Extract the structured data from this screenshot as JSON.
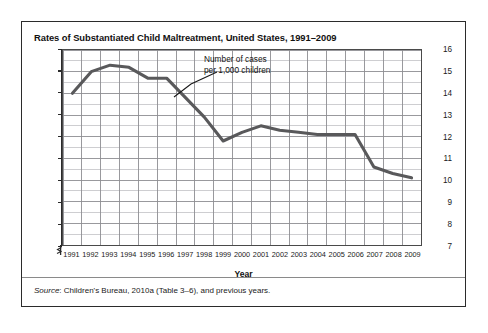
{
  "figure": {
    "title": "Rates of Substantiated Child Maltreatment, United States, 1991–2009",
    "source_lead": "Source",
    "source_text": ": Children's Bureau, 2010a (Table 3–6), and previous years."
  },
  "annotation": {
    "line1": "Number of cases",
    "line2": "per 1,000 children"
  },
  "axis": {
    "y_ticks": [
      "16",
      "15",
      "14",
      "13",
      "12",
      "11",
      "10",
      "9",
      "8",
      "7"
    ],
    "x_title": "Year"
  },
  "colors": {
    "line": "#59595b",
    "grid_major": "#8d8d91",
    "grid_minor": "#b9b9bd",
    "axis": "#2b2b2b",
    "border": "#2b2b2b",
    "background": "#ffffff"
  },
  "chart_data": {
    "type": "line",
    "title": "Rates of Substantiated Child Maltreatment, United States, 1991–2009",
    "xlabel": "Year",
    "ylabel": "Number of cases per 1,000 children",
    "categories": [
      1991,
      1992,
      1993,
      1994,
      1995,
      1996,
      1997,
      1998,
      1999,
      2000,
      2001,
      2002,
      2003,
      2004,
      2005,
      2006,
      2007,
      2008,
      2009
    ],
    "values": [
      14.0,
      15.0,
      15.3,
      15.2,
      14.7,
      14.7,
      13.8,
      12.9,
      11.8,
      12.2,
      12.5,
      12.3,
      12.2,
      12.1,
      12.1,
      12.1,
      10.6,
      10.3,
      10.1
    ],
    "series": [
      {
        "name": "Number of cases per 1,000 children",
        "values": [
          14.0,
          15.0,
          15.3,
          15.2,
          14.7,
          14.7,
          13.8,
          12.9,
          11.8,
          12.2,
          12.5,
          12.3,
          12.2,
          12.1,
          12.1,
          12.1,
          10.6,
          10.3,
          10.1
        ]
      }
    ],
    "ylim": [
      7,
      16
    ],
    "y_axis_broken": true,
    "y_tick_step": 1,
    "y_minor_step": 0.5,
    "grid": true,
    "legend": "none",
    "annotations": [
      {
        "text": "Number of cases per 1,000 children",
        "points_to_year": 1997
      }
    ]
  }
}
